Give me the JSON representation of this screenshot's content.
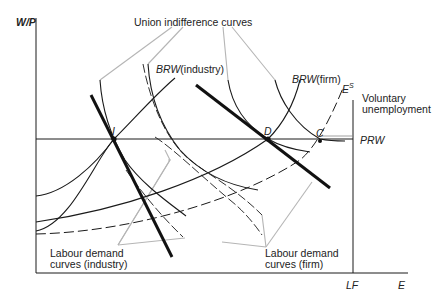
{
  "diagram": {
    "y_axis_label": "W/P",
    "x_axis_label": "E",
    "lf_label": "LF",
    "prw_label": "PRW",
    "es_label": "E",
    "es_sup": "S",
    "point_i": "I",
    "point_d": "D",
    "point_c": "C",
    "union_label": "Union indifference curves",
    "brw_industry_italic": "BRW",
    "brw_industry_rest": "(industry)",
    "brw_firm_italic": "BRW",
    "brw_firm_rest": "(firm)",
    "voluntary_line1": "Voluntary",
    "voluntary_line2": "unemployment",
    "ld_industry_line1": "Labour demand",
    "ld_industry_line2": "curves (industry)",
    "ld_firm_line1": "Labour demand",
    "ld_firm_line2": "curves (firm)"
  },
  "colors": {
    "line": "#1a1a1a",
    "leader": "#b5b5b5",
    "text": "#222222"
  }
}
